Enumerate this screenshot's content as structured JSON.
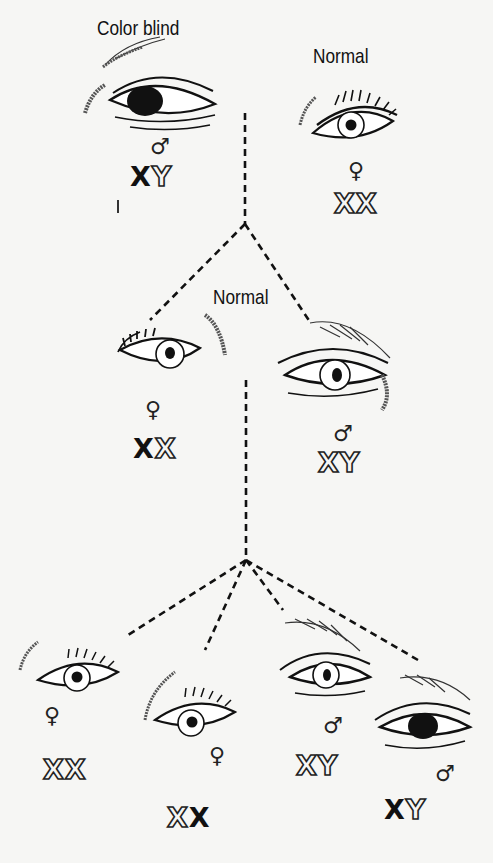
{
  "diagram": {
    "title_labels": {
      "top_left": "Color blind",
      "top_right": "Normal",
      "middle": "Normal"
    },
    "symbols": {
      "male": "♂",
      "female": "♀"
    },
    "generation_1": {
      "father": {
        "phenotype": "Color blind",
        "sex": "male",
        "chromosomes": [
          "X",
          "Y"
        ],
        "chromosome_styles": [
          "solid",
          "outline"
        ],
        "eye": "dark-iris"
      },
      "mother": {
        "phenotype": "Normal",
        "sex": "female",
        "chromosomes": [
          "X",
          "X"
        ],
        "chromosome_styles": [
          "outline",
          "outline"
        ],
        "eye": "normal"
      }
    },
    "generation_2": {
      "label": "Normal",
      "daughter": {
        "sex": "female",
        "chromosomes": [
          "X",
          "X"
        ],
        "chromosome_styles": [
          "solid",
          "outline"
        ],
        "eye": "normal"
      },
      "husband": {
        "sex": "male",
        "chromosomes": [
          "X",
          "Y"
        ],
        "chromosome_styles": [
          "outline",
          "outline"
        ],
        "eye": "normal"
      }
    },
    "generation_3": [
      {
        "sex": "female",
        "chromosomes": [
          "X",
          "X"
        ],
        "chromosome_styles": [
          "outline",
          "outline"
        ],
        "eye": "normal"
      },
      {
        "sex": "female",
        "chromosomes": [
          "X",
          "X"
        ],
        "chromosome_styles": [
          "outline",
          "solid"
        ],
        "eye": "normal"
      },
      {
        "sex": "male",
        "chromosomes": [
          "X",
          "Y"
        ],
        "chromosome_styles": [
          "outline",
          "outline"
        ],
        "eye": "normal"
      },
      {
        "sex": "male",
        "chromosomes": [
          "X",
          "Y"
        ],
        "chromosome_styles": [
          "solid",
          "outline"
        ],
        "eye": "dark-iris"
      }
    ]
  },
  "colors": {
    "ink": "#111111",
    "paper": "#f6f6f4",
    "bleed_text": "#d8d8d5"
  }
}
